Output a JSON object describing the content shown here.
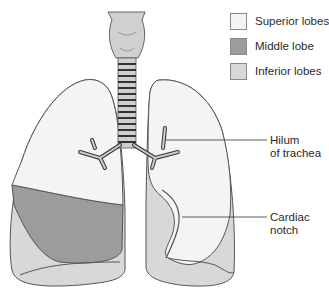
{
  "diagram": {
    "colors": {
      "superior": "#f4f4f4",
      "middle": "#9c9c9c",
      "inferior": "#d8d8d8",
      "outline": "#555555",
      "trachea": "#d0d0d0"
    }
  },
  "legend": {
    "items": [
      {
        "label": "Superior lobes",
        "color": "#f4f4f4"
      },
      {
        "label": "Middle lobe",
        "color": "#9c9c9c"
      },
      {
        "label": "Inferior lobes",
        "color": "#d8d8d8"
      }
    ]
  },
  "callouts": {
    "hilum": {
      "line1": "Hilum",
      "line2": "of trachea"
    },
    "cardiac": {
      "line1": "Cardiac",
      "line2": "notch"
    }
  }
}
